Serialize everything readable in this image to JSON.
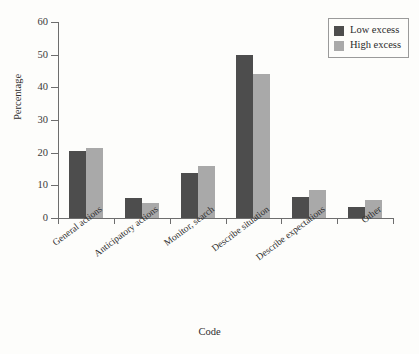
{
  "chart_data": {
    "type": "bar",
    "title": "",
    "xlabel": "Code",
    "ylabel": "Percentage",
    "ylim": [
      0,
      60
    ],
    "yticks": [
      0,
      10,
      20,
      30,
      40,
      50,
      60
    ],
    "grid": false,
    "legend_position": "top-right",
    "categories": [
      "General actions",
      "Anticipatory actions",
      "Monitor, search",
      "Describe situation",
      "Describe expectations",
      "Other"
    ],
    "series": [
      {
        "name": "Low excess",
        "color": "#4d4d4d",
        "values": [
          20.5,
          6.1,
          13.9,
          49.8,
          6.5,
          3.4
        ]
      },
      {
        "name": "High excess",
        "color": "#a9a9a9",
        "values": [
          21.3,
          4.5,
          15.9,
          44.0,
          8.5,
          5.5
        ]
      }
    ]
  },
  "axes": {
    "y_title": "Percentage",
    "x_title": "Code",
    "y_tick_labels": [
      "0",
      "10",
      "20",
      "30",
      "40",
      "50",
      "60"
    ]
  },
  "legend": {
    "entries": [
      {
        "label": "Low excess",
        "swatch": "low"
      },
      {
        "label": "High excess",
        "swatch": "high"
      }
    ]
  }
}
